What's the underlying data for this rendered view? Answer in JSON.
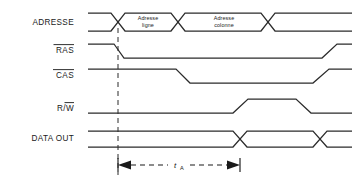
{
  "diagram": {
    "type": "timing-diagram",
    "width": 356,
    "height": 184,
    "stroke_color": "#2b2b2b",
    "text_color": "#1a1a1a",
    "background": "#ffffff"
  },
  "signals": [
    {
      "id": "adresse",
      "label": "ADRESSE",
      "label_overbar": "",
      "kind": "bus",
      "row_y": 22,
      "bus_half_height": 9,
      "segments": [
        {
          "name": "pre",
          "label": "",
          "start": 88,
          "end": 118
        },
        {
          "name": "row",
          "label_line1": "Adresse",
          "label_line2": "ligne",
          "start": 118,
          "end": 178
        },
        {
          "name": "col",
          "label_line1": "Adresse",
          "label_line2": "colonne",
          "start": 178,
          "end": 268
        },
        {
          "name": "post",
          "label": "",
          "start": 268,
          "end": 352
        }
      ],
      "crossings": [
        118,
        178,
        268
      ]
    },
    {
      "id": "ras",
      "label": "RAS",
      "label_overbar": "full",
      "kind": "logic",
      "row_y": 50,
      "amplitude": 11,
      "initial_level": "high",
      "edges": [
        {
          "t_start": 114,
          "t_end": 124,
          "to": "low"
        },
        {
          "t_start": 322,
          "t_end": 337,
          "to": "high"
        }
      ],
      "start_x": 88,
      "end_x": 352
    },
    {
      "id": "cas",
      "label": "CAS",
      "label_overbar": "full",
      "kind": "logic",
      "row_y": 75,
      "amplitude": 11,
      "initial_level": "high",
      "edges": [
        {
          "t_start": 176,
          "t_end": 190,
          "to": "low"
        },
        {
          "t_start": 313,
          "t_end": 329,
          "to": "high"
        }
      ],
      "start_x": 88,
      "end_x": 352
    },
    {
      "id": "rw",
      "label": "R/W",
      "label_overbar": "W",
      "kind": "logic",
      "row_y": 108,
      "amplitude": 11,
      "initial_level": "low",
      "edges": [
        {
          "t_start": 233,
          "t_end": 248,
          "to": "high"
        },
        {
          "t_start": 296,
          "t_end": 311,
          "to": "low"
        }
      ],
      "start_x": 88,
      "end_x": 352
    },
    {
      "id": "data_out",
      "label": "DATA OUT",
      "label_overbar": "",
      "kind": "bus",
      "row_y": 138,
      "bus_half_height": 8,
      "segments": [
        {
          "name": "invalid-pre",
          "label": "",
          "start": 88,
          "end": 240
        },
        {
          "name": "valid",
          "label": "",
          "start": 240,
          "end": 320
        },
        {
          "name": "invalid-post",
          "label": "",
          "start": 320,
          "end": 352
        }
      ],
      "crossings": [
        240,
        320
      ]
    }
  ],
  "cursor": {
    "name": "ras-falling-reference",
    "x": 118,
    "y_top": 28,
    "y_bottom": 175
  },
  "measurement": {
    "name": "access-time",
    "symbol": "t",
    "subscript": "A",
    "from_x": 118,
    "to_x": 240,
    "y": 165,
    "label_x": 179
  }
}
